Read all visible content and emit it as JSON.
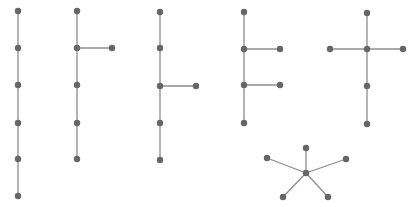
{
  "diagram": {
    "width": 411,
    "height": 207,
    "background": "#ffffff",
    "node_color": "#666666",
    "edge_color": "#8c8c8c",
    "node_radius": 3.2,
    "edge_width": 1.3,
    "graphs": [
      {
        "name": "path-6",
        "nodes": [
          [
            18,
            11
          ],
          [
            18,
            48
          ],
          [
            18,
            85
          ],
          [
            18,
            123
          ],
          [
            18,
            159
          ],
          [
            18,
            196
          ]
        ],
        "edges": [
          [
            0,
            1
          ],
          [
            1,
            2
          ],
          [
            2,
            3
          ],
          [
            3,
            4
          ],
          [
            4,
            5
          ]
        ]
      },
      {
        "name": "tree-branch-at-2",
        "nodes": [
          [
            77,
            11
          ],
          [
            77,
            48
          ],
          [
            77,
            85
          ],
          [
            77,
            123
          ],
          [
            77,
            159
          ],
          [
            112,
            48
          ]
        ],
        "edges": [
          [
            0,
            1
          ],
          [
            1,
            2
          ],
          [
            2,
            3
          ],
          [
            3,
            4
          ],
          [
            1,
            5
          ]
        ]
      },
      {
        "name": "tree-branch-at-3",
        "nodes": [
          [
            160,
            12
          ],
          [
            160,
            48
          ],
          [
            160,
            86
          ],
          [
            160,
            123
          ],
          [
            160,
            160
          ],
          [
            196,
            86
          ]
        ],
        "edges": [
          [
            0,
            1
          ],
          [
            1,
            2
          ],
          [
            2,
            3
          ],
          [
            3,
            4
          ],
          [
            2,
            5
          ]
        ]
      },
      {
        "name": "tree-two-branches",
        "nodes": [
          [
            244,
            12
          ],
          [
            244,
            49
          ],
          [
            244,
            85
          ],
          [
            244,
            123
          ],
          [
            280,
            49
          ],
          [
            280,
            85
          ]
        ],
        "edges": [
          [
            0,
            1
          ],
          [
            1,
            2
          ],
          [
            2,
            3
          ],
          [
            1,
            4
          ],
          [
            2,
            5
          ]
        ]
      },
      {
        "name": "tree-cross",
        "nodes": [
          [
            367,
            13
          ],
          [
            367,
            49
          ],
          [
            367,
            86
          ],
          [
            367,
            124
          ],
          [
            330,
            49
          ],
          [
            403,
            49
          ]
        ],
        "edges": [
          [
            0,
            1
          ],
          [
            1,
            2
          ],
          [
            2,
            3
          ],
          [
            4,
            1
          ],
          [
            1,
            5
          ]
        ]
      },
      {
        "name": "star-5",
        "nodes": [
          [
            306,
            173
          ],
          [
            306,
            148
          ],
          [
            267,
            158
          ],
          [
            346,
            159
          ],
          [
            283,
            197
          ],
          [
            328,
            197
          ]
        ],
        "edges": [
          [
            0,
            1
          ],
          [
            0,
            2
          ],
          [
            0,
            3
          ],
          [
            0,
            4
          ],
          [
            0,
            5
          ]
        ]
      }
    ]
  }
}
